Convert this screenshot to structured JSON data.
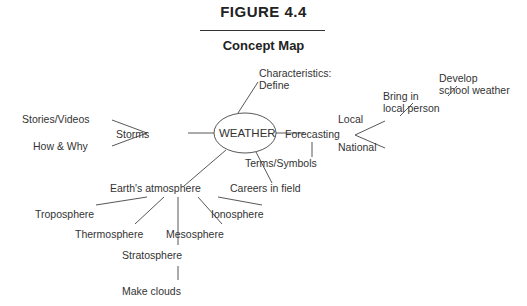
{
  "figure": {
    "label": "FIGURE 4.4",
    "title": "Concept Map"
  },
  "center_node": "WEATHER",
  "nodes": {
    "characteristics": "Characteristics:",
    "define": "Define",
    "storms": "Storms",
    "stories_videos": "Stories/Videos",
    "how_why": "How & Why",
    "forecasting": "Forecasting",
    "local": "Local",
    "national": "National",
    "bring_in": "Bring in",
    "local_person": "local person",
    "develop": "Develop",
    "school_weather": "school weather",
    "terms_symbols": "Terms/Symbols",
    "careers": "Careers in field",
    "earths_atmosphere": "Earth's atmosphere",
    "troposphere": "Troposphere",
    "thermosphere": "Thermosphere",
    "stratosphere": "Stratosphere",
    "mesosphere": "Mesosphere",
    "ionosphere": "Ionosphere",
    "make_clouds": "Make clouds"
  },
  "colors": {
    "line": "#444444",
    "text": "#333333",
    "background": "#ffffff"
  }
}
